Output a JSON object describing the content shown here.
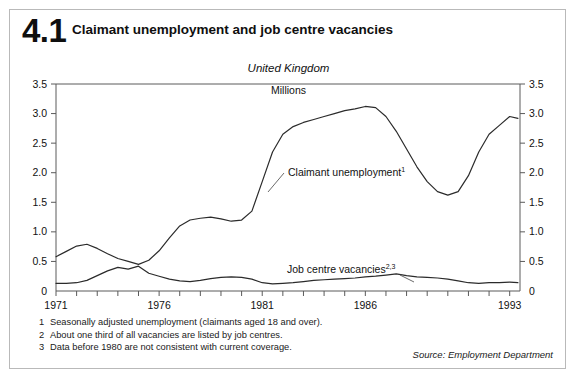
{
  "figure": {
    "number": "4.1",
    "title": "Claimant unemployment and job centre vacancies",
    "region_label": "United Kingdom",
    "units_label": "Millions",
    "source": "Source: Employment Department"
  },
  "footnotes": [
    {
      "num": "1",
      "text": "Seasonally adjusted unemployment  (claimants aged 18 and over)."
    },
    {
      "num": "2",
      "text": "About one third of all vacancies are listed by job centres."
    },
    {
      "num": "3",
      "text": "Data before 1980 are not consistent with current coverage."
    }
  ],
  "annotations": {
    "claimant_label": "Claimant unemployment",
    "claimant_sup": "1",
    "vacancies_label": "Job centre vacancies",
    "vacancies_sup": "2,3"
  },
  "axis": {
    "y_ticks": [
      "0",
      "0.5",
      "1.0",
      "1.5",
      "2.0",
      "2.5",
      "3.0",
      "3.5"
    ],
    "x_labels": [
      "1971",
      "1976",
      "1981",
      "1986",
      "1993"
    ]
  },
  "chart_data": {
    "type": "line",
    "title": "Claimant unemployment and job centre vacancies",
    "subtitle": "United Kingdom",
    "xlabel": "",
    "ylabel": "Millions",
    "ylim": [
      0,
      3.5
    ],
    "xlim": [
      1971,
      1993.5
    ],
    "ytick_values": [
      0,
      0.5,
      1.0,
      1.5,
      2.0,
      2.5,
      3.0,
      3.5
    ],
    "xtick_values": [
      1971,
      1972,
      1973,
      1974,
      1975,
      1976,
      1977,
      1978,
      1979,
      1980,
      1981,
      1982,
      1983,
      1984,
      1985,
      1986,
      1987,
      1988,
      1989,
      1990,
      1991,
      1992,
      1993
    ],
    "xtick_labels_shown": [
      1971,
      1976,
      1981,
      1986,
      1993
    ],
    "grid": false,
    "legend": "inline-annotations",
    "line_color": "#2b2b2b",
    "x": [
      1971.0,
      1971.5,
      1972.0,
      1972.5,
      1973.0,
      1973.5,
      1974.0,
      1974.5,
      1975.0,
      1975.5,
      1976.0,
      1976.5,
      1977.0,
      1977.5,
      1978.0,
      1978.5,
      1979.0,
      1979.5,
      1980.0,
      1980.5,
      1981.0,
      1981.5,
      1982.0,
      1982.5,
      1983.0,
      1983.5,
      1984.0,
      1984.5,
      1985.0,
      1985.5,
      1986.0,
      1986.5,
      1987.0,
      1987.5,
      1988.0,
      1988.5,
      1989.0,
      1989.5,
      1990.0,
      1990.5,
      1991.0,
      1991.5,
      1992.0,
      1992.5,
      1993.0,
      1993.4
    ],
    "series": [
      {
        "name": "Claimant unemployment",
        "footnote": "1",
        "values": [
          0.58,
          0.67,
          0.76,
          0.79,
          0.72,
          0.63,
          0.55,
          0.5,
          0.45,
          0.52,
          0.68,
          0.9,
          1.1,
          1.2,
          1.23,
          1.25,
          1.22,
          1.18,
          1.2,
          1.35,
          1.85,
          2.35,
          2.65,
          2.78,
          2.85,
          2.9,
          2.95,
          3.0,
          3.05,
          3.08,
          3.12,
          3.1,
          2.95,
          2.7,
          2.4,
          2.1,
          1.85,
          1.68,
          1.62,
          1.68,
          1.95,
          2.35,
          2.65,
          2.8,
          2.95,
          2.92
        ]
      },
      {
        "name": "Job centre vacancies",
        "footnote": "2,3",
        "values": [
          0.13,
          0.13,
          0.14,
          0.18,
          0.26,
          0.34,
          0.4,
          0.37,
          0.42,
          0.3,
          0.25,
          0.2,
          0.17,
          0.16,
          0.18,
          0.21,
          0.23,
          0.24,
          0.23,
          0.2,
          0.14,
          0.12,
          0.13,
          0.14,
          0.16,
          0.18,
          0.19,
          0.2,
          0.21,
          0.22,
          0.24,
          0.25,
          0.27,
          0.29,
          0.26,
          0.24,
          0.23,
          0.22,
          0.2,
          0.17,
          0.14,
          0.13,
          0.14,
          0.14,
          0.15,
          0.14
        ]
      }
    ]
  }
}
